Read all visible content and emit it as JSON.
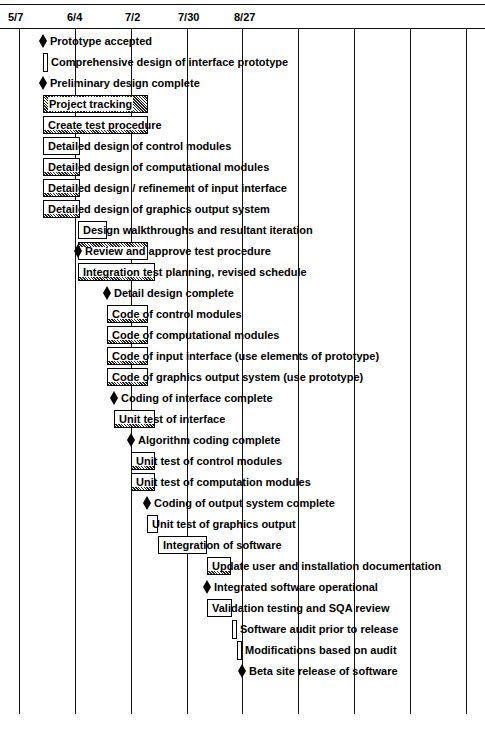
{
  "chart_data": {
    "type": "gantt",
    "title": "",
    "header_dates": [
      "5/7",
      "6/4",
      "7/2",
      "7/30",
      "8/27"
    ],
    "grid_lines_x": [
      20,
      75,
      132,
      187,
      242,
      298,
      354,
      410,
      466
    ],
    "date_positions": {
      "5/7": 20,
      "6/4": 75,
      "7/2": 132,
      "7/30": 187,
      "8/27": 242
    },
    "tasks": [
      {
        "label": "Prototype accepted",
        "type": "milestone",
        "x": 43,
        "row": 0
      },
      {
        "label": "Comprehensive design of interface prototype",
        "type": "task",
        "start": 43,
        "end": 48,
        "row": 1
      },
      {
        "label": "Preliminary design complete",
        "type": "milestone",
        "x": 43,
        "row": 2
      },
      {
        "label": "Project tracking",
        "type": "task",
        "start": 43,
        "end": 148,
        "row": 3,
        "progress": "full"
      },
      {
        "label": "Create test procedure",
        "type": "task",
        "start": 43,
        "end": 148,
        "row": 4,
        "progress": "partial"
      },
      {
        "label": "Detailed design of control modules",
        "type": "task",
        "start": 43,
        "end": 80,
        "row": 5
      },
      {
        "label": "Detailed design of computational modules",
        "type": "task",
        "start": 43,
        "end": 80,
        "row": 6,
        "progress": "partial"
      },
      {
        "label": "Detailed design / refinement of input interface",
        "type": "task",
        "start": 43,
        "end": 80,
        "row": 7,
        "progress": "partial"
      },
      {
        "label": "Detailed design of graphics output system",
        "type": "task",
        "start": 43,
        "end": 80,
        "row": 8,
        "progress": "partial"
      },
      {
        "label": "Design walkthroughs and resultant iteration",
        "type": "task",
        "start": 78,
        "end": 107,
        "row": 9
      },
      {
        "label": "Review and approve test procedure",
        "type": "milestone",
        "x": 78,
        "row": 10,
        "bar_start": 78,
        "bar_end": 148,
        "progress": "partial"
      },
      {
        "label": "Integration test planning, revised schedule",
        "type": "task",
        "start": 78,
        "end": 155,
        "row": 11,
        "progress": "partial"
      },
      {
        "label": "Detail design complete",
        "type": "milestone",
        "x": 107,
        "row": 12
      },
      {
        "label": "Code of control modules",
        "type": "task",
        "start": 107,
        "end": 148,
        "row": 13,
        "progress": "partial"
      },
      {
        "label": "Code of computational modules",
        "type": "task",
        "start": 107,
        "end": 148,
        "row": 14,
        "progress": "partial"
      },
      {
        "label": "Code of input interface (use elements of prototype)",
        "type": "task",
        "start": 107,
        "end": 148,
        "row": 15,
        "progress": "partial"
      },
      {
        "label": "Code of graphics output system (use prototype)",
        "type": "task",
        "start": 107,
        "end": 148,
        "row": 16,
        "progress": "partial"
      },
      {
        "label": "Coding of interface complete",
        "type": "milestone",
        "x": 114,
        "row": 17
      },
      {
        "label": "Unit test of interface",
        "type": "task",
        "start": 114,
        "end": 155,
        "row": 18,
        "progress": "partial"
      },
      {
        "label": "Algorithm coding complete",
        "type": "milestone",
        "x": 131,
        "row": 19
      },
      {
        "label": "Unit test of control modules",
        "type": "task",
        "start": 131,
        "end": 155,
        "row": 20,
        "progress": "partial"
      },
      {
        "label": "Unit test of computation modules",
        "type": "task",
        "start": 131,
        "end": 155,
        "row": 21,
        "progress": "partial"
      },
      {
        "label": "Coding of output system complete",
        "type": "milestone",
        "x": 147,
        "row": 22
      },
      {
        "label": "Unit test of graphics output",
        "type": "task",
        "start": 147,
        "end": 158,
        "row": 23
      },
      {
        "label": "Integration of software",
        "type": "task",
        "start": 158,
        "end": 207,
        "row": 24
      },
      {
        "label": "Update user and installation documentation",
        "type": "task",
        "start": 207,
        "end": 231,
        "row": 25,
        "progress": "partial"
      },
      {
        "label": "Integrated software operational",
        "type": "milestone",
        "x": 207,
        "row": 26
      },
      {
        "label": "Validation testing and SQA review",
        "type": "task",
        "start": 207,
        "end": 232,
        "row": 27
      },
      {
        "label": "Software audit prior to release",
        "type": "task",
        "start": 232,
        "end": 237,
        "row": 28
      },
      {
        "label": "Modifications based on audit",
        "type": "task",
        "start": 237,
        "end": 242,
        "row": 29
      },
      {
        "label": "Beta site release of software",
        "type": "milestone",
        "x": 242,
        "row": 30
      }
    ]
  },
  "header": {
    "dates": [
      "5/7",
      "6/4",
      "7/2",
      "7/30",
      "8/27"
    ]
  },
  "rows": [
    "Prototype accepted",
    "Comprehensive design of interface prototype",
    "Preliminary design complete",
    "Project tracking",
    "Create test procedure",
    "Detailed design of control modules",
    "Detailed design of computational modules",
    "Detailed design / refinement of input interface",
    "Detailed design of graphics output system",
    "Design walkthroughs and resultant iteration",
    "Review and approve test procedure",
    "Integration test planning, revised schedule",
    "Detail design complete",
    "Code of control modules",
    "Code of computational modules",
    "Code of input interface (use elements of prototype)",
    "Code of graphics output system (use prototype)",
    "Coding of interface complete",
    "Unit test of interface",
    "Algorithm coding complete",
    "Unit test of control modules",
    "Unit test of computation modules",
    "Coding of output system complete",
    "Unit test of graphics output",
    "Integration of software",
    "Update user and installation documentation",
    "Integrated software operational",
    "Validation testing and SQA review",
    "Software audit prior to release",
    "Modifications based on audit",
    "Beta site release of software"
  ]
}
